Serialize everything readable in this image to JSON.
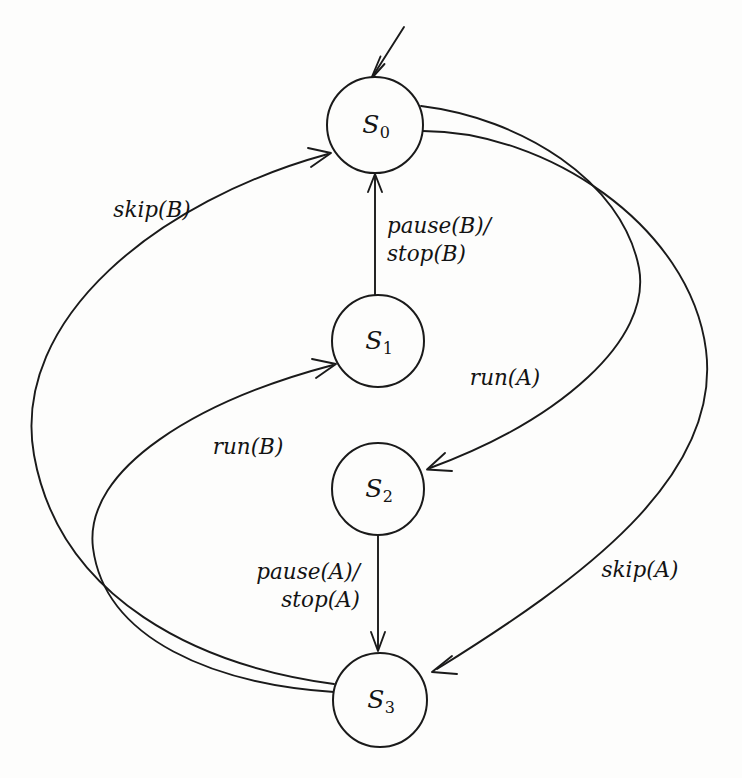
{
  "diagram": {
    "type": "finite-state-machine",
    "title": "",
    "background_color": "#fdfdfc",
    "stroke_color": "#1a1a1a",
    "states": [
      {
        "id": "S0",
        "label_main": "S",
        "label_sub": "0",
        "cx": 375,
        "cy": 125,
        "r": 48,
        "initial": true
      },
      {
        "id": "S1",
        "label_main": "S",
        "label_sub": "1",
        "cx": 378,
        "cy": 341,
        "r": 46,
        "initial": false
      },
      {
        "id": "S2",
        "label_main": "S",
        "label_sub": "2",
        "cx": 378,
        "cy": 489,
        "r": 46,
        "initial": false
      },
      {
        "id": "S3",
        "label_main": "S",
        "label_sub": "3",
        "cx": 380,
        "cy": 700,
        "r": 47,
        "initial": false
      }
    ],
    "transitions": [
      {
        "id": "t-init",
        "from": "",
        "to": "S0",
        "label_lines": [],
        "label_x": 0,
        "label_y": 0
      },
      {
        "id": "t-s1-s0",
        "from": "S1",
        "to": "S0",
        "label_lines": [
          "pause(B)/",
          "stop(B)"
        ],
        "label_x": 387,
        "label_y": 240,
        "align": "leftal"
      },
      {
        "id": "t-s0-s2",
        "from": "S0",
        "to": "S2",
        "label_lines": [
          "run(A)"
        ],
        "label_x": 505,
        "label_y": 378,
        "align": "center"
      },
      {
        "id": "t-s2-s3",
        "from": "S2",
        "to": "S3",
        "label_lines": [
          "pause(A)/",
          "stop(A)"
        ],
        "label_x": 360,
        "label_y": 586,
        "align": "rightal"
      },
      {
        "id": "t-s0-s3",
        "from": "S0",
        "to": "S3",
        "label_lines": [
          "skip(A)"
        ],
        "label_x": 640,
        "label_y": 570,
        "align": "center"
      },
      {
        "id": "t-s3-s0",
        "from": "S3",
        "to": "S0",
        "label_lines": [
          "skip(B)"
        ],
        "label_x": 152,
        "label_y": 210,
        "align": "center"
      },
      {
        "id": "t-s3-s1",
        "from": "S3",
        "to": "S1",
        "label_lines": [
          "run(B)"
        ],
        "label_x": 248,
        "label_y": 447,
        "align": "center"
      }
    ]
  }
}
